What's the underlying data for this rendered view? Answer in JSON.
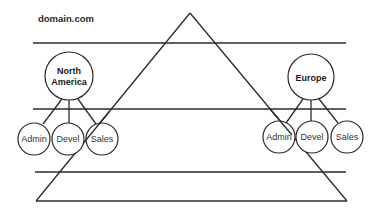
{
  "diagram": {
    "title": "domain.com",
    "colors": {
      "stroke": "#2a2a2a",
      "background": "#ffffff",
      "text": "#1a1a1a"
    },
    "regions": [
      {
        "name": "North America",
        "label_lines": [
          "North",
          "America"
        ],
        "children": [
          "Admin",
          "Devel",
          "Sales"
        ]
      },
      {
        "name": "Europe",
        "label_lines": [
          "Europe"
        ],
        "children": [
          "Admin",
          "Devel",
          "Sales"
        ]
      }
    ],
    "shape": "triangle",
    "horizontal_lines": 4
  }
}
